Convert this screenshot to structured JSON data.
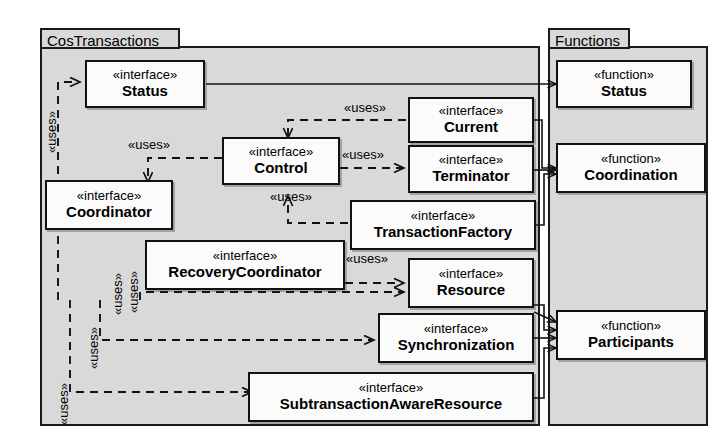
{
  "diagram": {
    "kind": "uml-package-diagram",
    "width": 717,
    "height": 444,
    "background": "#ffffff",
    "package_fill": "#d9d9d9",
    "node_fill": "#fbfbfb",
    "line_color": "#111111"
  },
  "packages": [
    {
      "id": "cos",
      "name": "CosTransactions"
    },
    {
      "id": "fn",
      "name": "Functions"
    }
  ],
  "stereotypes": {
    "interface": "«interface»",
    "function": "«function»"
  },
  "nodes": [
    {
      "id": "status",
      "package": "cos",
      "stereotype": "«interface»",
      "name": "Status"
    },
    {
      "id": "current",
      "package": "cos",
      "stereotype": "«interface»",
      "name": "Current"
    },
    {
      "id": "control",
      "package": "cos",
      "stereotype": "«interface»",
      "name": "Control"
    },
    {
      "id": "terminator",
      "package": "cos",
      "stereotype": "«interface»",
      "name": "Terminator"
    },
    {
      "id": "coordinator",
      "package": "cos",
      "stereotype": "«interface»",
      "name": "Coordinator"
    },
    {
      "id": "txfactory",
      "package": "cos",
      "stereotype": "«interface»",
      "name": "TransactionFactory"
    },
    {
      "id": "recovery",
      "package": "cos",
      "stereotype": "«interface»",
      "name": "RecoveryCoordinator"
    },
    {
      "id": "resource",
      "package": "cos",
      "stereotype": "«interface»",
      "name": "Resource"
    },
    {
      "id": "sync",
      "package": "cos",
      "stereotype": "«interface»",
      "name": "Synchronization"
    },
    {
      "id": "subres",
      "package": "cos",
      "stereotype": "«interface»",
      "name": "SubtransactionAwareResource"
    },
    {
      "id": "fstatus",
      "package": "fn",
      "stereotype": "«function»",
      "name": "Status"
    },
    {
      "id": "fcoord",
      "package": "fn",
      "stereotype": "«function»",
      "name": "Coordination"
    },
    {
      "id": "fpart",
      "package": "fn",
      "stereotype": "«function»",
      "name": "Participants"
    }
  ],
  "edge_label": "«uses»",
  "edge_labels": [
    {
      "id": "u-left-status",
      "text": "«uses»",
      "orientation": "vertical"
    },
    {
      "id": "u-current-control",
      "text": "«uses»",
      "orientation": "horizontal"
    },
    {
      "id": "u-control-coord",
      "text": "«uses»",
      "orientation": "horizontal"
    },
    {
      "id": "u-control-term",
      "text": "«uses»",
      "orientation": "horizontal"
    },
    {
      "id": "u-txf-control",
      "text": "«uses»",
      "orientation": "horizontal"
    },
    {
      "id": "u-recovery-resource",
      "text": "«uses»",
      "orientation": "horizontal"
    },
    {
      "id": "u-coord-recovery",
      "text": "«uses»",
      "orientation": "vertical"
    },
    {
      "id": "u-coord-resource",
      "text": "«uses»",
      "orientation": "vertical"
    },
    {
      "id": "u-coord-sync",
      "text": "«uses»",
      "orientation": "vertical"
    },
    {
      "id": "u-coord-subres",
      "text": "«uses»",
      "orientation": "vertical"
    }
  ]
}
